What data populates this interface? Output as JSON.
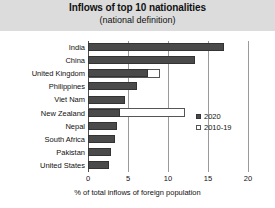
{
  "chart_data": {
    "type": "bar",
    "title": "Inflows of top 10 nationalities",
    "subtitle": "(national definition)",
    "xlabel": "% of total inflows of foreign population",
    "ylabel": "",
    "orientation": "horizontal",
    "xlim": [
      0,
      20
    ],
    "xticks": [
      0,
      5,
      10,
      15,
      20
    ],
    "xtick_labels": [
      "0",
      "5",
      "10",
      "15",
      "20"
    ],
    "grid": true,
    "legend_position": "center-right",
    "categories": [
      "India",
      "China",
      "United Kingdom",
      "Philippines",
      "Viet Nam",
      "New Zealand",
      "Nepal",
      "South Africa",
      "Pakistan",
      "United States"
    ],
    "series": [
      {
        "name": "2020",
        "style": "filled",
        "color": "#4a4a4a",
        "values": [
          17.0,
          13.4,
          7.5,
          6.1,
          4.6,
          4.0,
          3.6,
          3.4,
          2.9,
          2.6
        ]
      },
      {
        "name": "2010-19",
        "style": "hollow",
        "color": "#ffffff",
        "values": [
          null,
          null,
          9.0,
          null,
          null,
          12.1,
          null,
          null,
          null,
          null
        ]
      }
    ]
  },
  "legend": {
    "entries": [
      {
        "label": "2020",
        "swatch": "filled-square-icon"
      },
      {
        "label": "2010-19",
        "swatch": "hollow-square-icon"
      }
    ]
  }
}
